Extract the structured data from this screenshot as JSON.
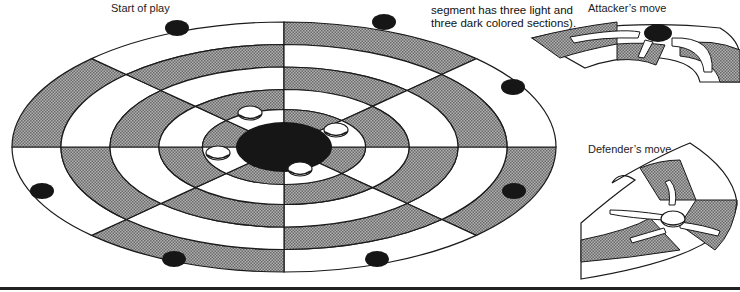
{
  "labels": {
    "start_of_play": "Start of play",
    "caption_line1": "segment has three light and",
    "caption_line2": "three dark colored sections).",
    "attackers_move": "Attacker’s move",
    "defenders_move": "Defender’s move"
  },
  "board": {
    "sectors": 8,
    "rings": 5,
    "attacker_pieces": 8,
    "defender_pieces": 4
  },
  "colors": {
    "light": "#ffffff",
    "dark": "#9a9a9a",
    "line": "#1a1a1a",
    "piece_dark": "#161616"
  }
}
